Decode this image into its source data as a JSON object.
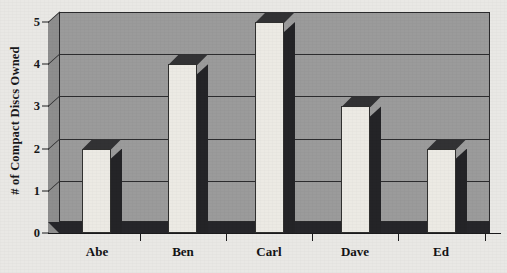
{
  "chart_data": {
    "type": "bar",
    "title": "",
    "subtitle": "",
    "categories": [
      "Abe",
      "Ben",
      "Carl",
      "Dave",
      "Ed"
    ],
    "values": [
      2,
      4,
      5,
      3,
      2
    ],
    "xlabel": "",
    "ylabel": "# of Compact Discs Owned",
    "ylim": [
      0,
      5
    ],
    "ytick_labels": [
      "0",
      "1",
      "2",
      "3",
      "4",
      "5"
    ],
    "ytick_values": [
      0,
      1,
      2,
      3,
      4,
      5
    ],
    "grid": true,
    "legend": false,
    "legend_position": "none",
    "style": "3d-bar",
    "annotations": []
  },
  "colors": {
    "page_background": "#e9e8e5",
    "plot_background": "#9b9b9b",
    "plot_left_wall": "#8e8e8e",
    "bar_face": "#eceae4",
    "bar_side": "#242427",
    "bar_top": "#323234",
    "floor_shadow": "#26262a",
    "axis_line": "#1b1b1d",
    "grid_line": "#2c2c2e",
    "text": "#131315"
  }
}
